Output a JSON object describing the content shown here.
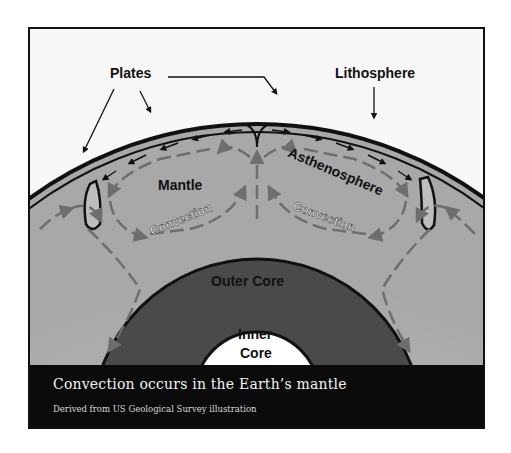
{
  "diagram": {
    "labels": {
      "plates": "Plates",
      "lithosphere": "Lithosphere",
      "asthenosphere": "Asthenosphere",
      "mantle": "Mantle",
      "convection_left": "Convection",
      "convection_right": "Convection",
      "outer_core": "Outer Core",
      "inner_core_line1": "Inner",
      "inner_core_line2": "Core"
    },
    "colors": {
      "background": "#f7f7f7",
      "mantle": "#b4b4b4",
      "outer_core_edge": "#555555",
      "outer_core_center": "#e8e8e8",
      "inner_core": "#ffffff",
      "arrows": "#6e6e6e",
      "outline": "#111111",
      "caption_bg": "#0b0b0b"
    }
  },
  "caption": {
    "title": "Convection occurs in the Earth’s mantle",
    "subtitle": "Derived from US Geological Survey illustration"
  }
}
